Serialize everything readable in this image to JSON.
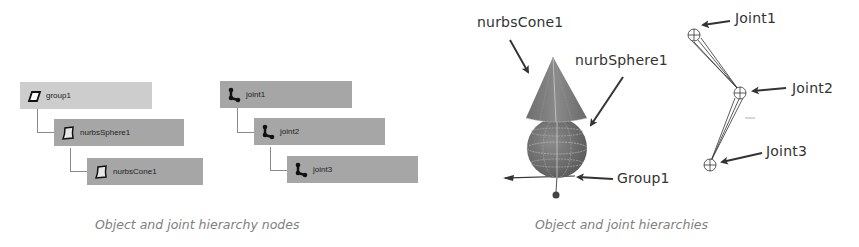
{
  "left_panel": {
    "caption": "Object and joint hierarchy nodes",
    "object_hierarchy": [
      {
        "label": "group1",
        "icon": "transform-parallelogram-icon",
        "level": 0
      },
      {
        "label": "nurbsSphere1",
        "icon": "nurbs-surface-icon",
        "level": 1
      },
      {
        "label": "nurbsCone1",
        "icon": "nurbs-surface-icon",
        "level": 2
      }
    ],
    "joint_hierarchy": [
      {
        "label": "joint1",
        "icon": "joint-icon",
        "level": 0
      },
      {
        "label": "joint2",
        "icon": "joint-icon",
        "level": 1
      },
      {
        "label": "joint3",
        "icon": "joint-icon",
        "level": 2
      }
    ]
  },
  "right_panel": {
    "caption": "Object and joint hierarchies",
    "labels": {
      "nurbs_cone": "nurbsCone1",
      "nurbs_sphere": "nurbSphere1",
      "group": "Group1",
      "joint1": "Joint1",
      "joint2": "Joint2",
      "joint3": "Joint3"
    }
  },
  "colors": {
    "node_light": "#cdcdcd",
    "node_dark": "#a6a6a6",
    "caption": "#808080",
    "label": "#333333",
    "object_fill": "#7a7a7a"
  }
}
